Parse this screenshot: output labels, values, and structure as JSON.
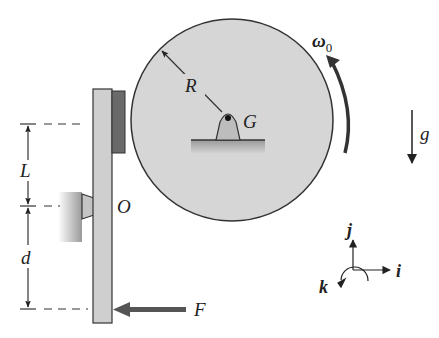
{
  "figure": {
    "type": "mechanics-diagram",
    "labels": {
      "radius": "R",
      "center_of_mass": "G",
      "angular_velocity": "ω",
      "angular_velocity_sub": "0",
      "gravity": "g",
      "pivot": "O",
      "upper_length": "L",
      "lower_length": "d",
      "force": "F",
      "axis_i": "i",
      "axis_j": "j",
      "axis_k": "k"
    },
    "colors": {
      "disk_fill": "#d6d6d6",
      "arm_fill": "#cfcfcf",
      "brake_pad": "#6a6a6a",
      "arrow": "#555555",
      "line": "#333333"
    }
  }
}
